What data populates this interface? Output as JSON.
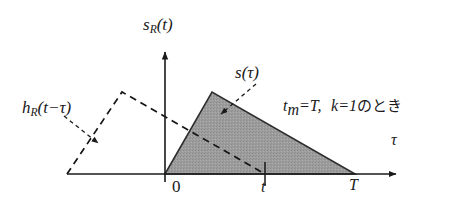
{
  "figure": {
    "title": "",
    "background_color": "#ffffff",
    "axes": {
      "vertical": {
        "label_main": "s",
        "label_sub": "R",
        "label_arg": "(t)",
        "x": 165,
        "y_top": 48,
        "y_bottom": 174,
        "color": "#1a1a1a"
      },
      "horizontal": {
        "label": "τ",
        "y": 174,
        "x_left": 67,
        "x_right": 400,
        "color": "#1a1a1a"
      }
    },
    "ticks": [
      {
        "label": "0",
        "x": 165,
        "kind": "origin"
      },
      {
        "label": "t",
        "x": 265,
        "kind": "minor"
      },
      {
        "label": "T",
        "x": 355,
        "kind": "minor"
      }
    ],
    "signal_s": {
      "name_main": "s",
      "name_arg": "(τ)",
      "fill_color": "#9d9d9d",
      "edge_color": "#2a2a2a",
      "points": [
        [
          165,
          174
        ],
        [
          212,
          92
        ],
        [
          355,
          174
        ]
      ],
      "peak_x": 212,
      "peak_y": 92,
      "start_x": 165,
      "end_x": 355
    },
    "signal_h": {
      "name_main": "h",
      "name_sub": "R",
      "name_arg": "(t−τ)",
      "line_style": "dashed",
      "color": "#1a1a1a",
      "points": [
        [
          67,
          174
        ],
        [
          122,
          92
        ],
        [
          265,
          174
        ]
      ],
      "peak_x": 122,
      "peak_y": 92,
      "start_x": 67,
      "end_x": 265
    },
    "annotation": {
      "condition_t": "t",
      "condition_t_sub": "m",
      "condition_eq1": "=T,",
      "condition_k": "k",
      "condition_eq2": "=1",
      "condition_jp": "のとき",
      "full_text": "t_m=T,  k=1のとき"
    },
    "callouts": [
      {
        "name": "s-tau-callout",
        "from": [
          256,
          84
        ],
        "to": [
          219,
          116
        ]
      },
      {
        "name": "h-r-callout",
        "from": [
          66,
          116
        ],
        "to": [
          100,
          144
        ]
      }
    ]
  }
}
